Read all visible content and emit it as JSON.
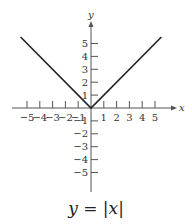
{
  "chart_data": {
    "type": "line",
    "title": "",
    "caption": "y = |x|",
    "xlabel": "x",
    "ylabel": "y",
    "xlim": [
      -5.5,
      5.5
    ],
    "ylim": [
      -6,
      6.5
    ],
    "x_ticks": [
      -5,
      -4,
      -3,
      -2,
      -1,
      1,
      2,
      3,
      4,
      5
    ],
    "y_ticks": [
      5,
      4,
      3,
      2,
      1,
      -1,
      -2,
      -3,
      -4,
      -5
    ],
    "grid": false,
    "series": [
      {
        "name": "y = |x|",
        "x": [
          -5.5,
          0,
          5.5
        ],
        "y": [
          5.5,
          0,
          5.5
        ]
      }
    ]
  },
  "labels": {
    "x_axis": "x",
    "y_axis": "y",
    "caption_lhs": "y",
    "caption_eq": " = ",
    "caption_rhs": "|x|"
  }
}
